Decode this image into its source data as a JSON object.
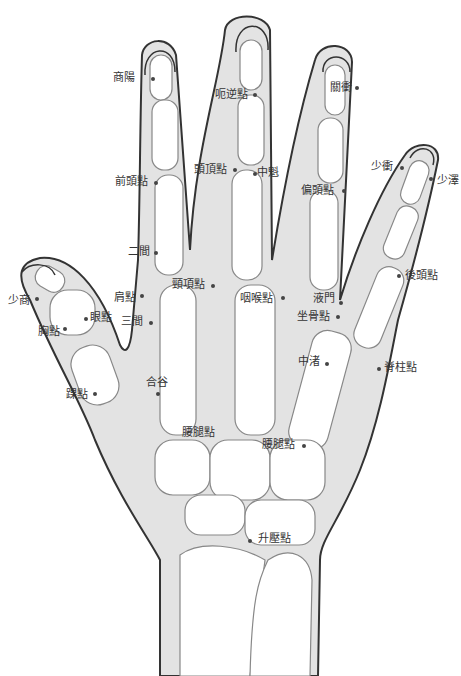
{
  "diagram": {
    "type": "hand-acupoint-chart",
    "colors": {
      "skin": "#e3e3e3",
      "bone": "#ffffff",
      "outline": "#333333",
      "bone_line": "#888888",
      "text": "#333333"
    },
    "points": [
      {
        "id": "shangyang",
        "label": "商陽",
        "x": 113,
        "y": 72,
        "dx": 152,
        "dy": 78
      },
      {
        "id": "eni",
        "label": "呃逆點",
        "x": 215,
        "y": 89,
        "dx": 254,
        "dy": 94
      },
      {
        "id": "guanchong",
        "label": "關衝",
        "x": 330,
        "y": 82,
        "dx": 356,
        "dy": 87
      },
      {
        "id": "shaochong",
        "label": "少衝",
        "x": 371,
        "y": 161,
        "dx": 401,
        "dy": 167
      },
      {
        "id": "shaoze",
        "label": "少澤",
        "x": 437,
        "y": 175,
        "dx": 430,
        "dy": 178
      },
      {
        "id": "touding",
        "label": "頭頂點",
        "x": 194,
        "y": 164,
        "dx": 234,
        "dy": 169
      },
      {
        "id": "zhongkui",
        "label": "中魁",
        "x": 257,
        "y": 167,
        "dx": 254,
        "dy": 173
      },
      {
        "id": "qiantou",
        "label": "前頭點",
        "x": 115,
        "y": 176,
        "dx": 155,
        "dy": 182
      },
      {
        "id": "piantou",
        "label": "偏頭點",
        "x": 301,
        "y": 185,
        "dx": 343,
        "dy": 190
      },
      {
        "id": "erjian",
        "label": "二間",
        "x": 128,
        "y": 246,
        "dx": 155,
        "dy": 252
      },
      {
        "id": "houtou",
        "label": "後頭點",
        "x": 405,
        "y": 270,
        "dx": 398,
        "dy": 275
      },
      {
        "id": "jingxiang",
        "label": "頸項點",
        "x": 172,
        "y": 279,
        "dx": 212,
        "dy": 285
      },
      {
        "id": "yanhou",
        "label": "咽喉點",
        "x": 240,
        "y": 293,
        "dx": 282,
        "dy": 297
      },
      {
        "id": "yemen",
        "label": "液門",
        "x": 313,
        "y": 293,
        "dx": 340,
        "dy": 302
      },
      {
        "id": "jian",
        "label": "肩點",
        "x": 114,
        "y": 292,
        "dx": 141,
        "dy": 295
      },
      {
        "id": "shaoshang",
        "label": "少商",
        "x": 8,
        "y": 295,
        "dx": 36,
        "dy": 298
      },
      {
        "id": "zuogu",
        "label": "坐骨點",
        "x": 297,
        "y": 311,
        "dx": 337,
        "dy": 316
      },
      {
        "id": "yan",
        "label": "眼點",
        "x": 90,
        "y": 312,
        "dx": 85,
        "dy": 318
      },
      {
        "id": "sanjian",
        "label": "三間",
        "x": 121,
        "y": 316,
        "dx": 150,
        "dy": 322
      },
      {
        "id": "xiong",
        "label": "胸點",
        "x": 38,
        "y": 326,
        "dx": 64,
        "dy": 328
      },
      {
        "id": "zhongzhu",
        "label": "中渚",
        "x": 298,
        "y": 356,
        "dx": 326,
        "dy": 363
      },
      {
        "id": "jizhu",
        "label": "脊柱點",
        "x": 384,
        "y": 362,
        "dx": 378,
        "dy": 368
      },
      {
        "id": "hegu",
        "label": "合谷",
        "x": 146,
        "y": 377,
        "dx": 157,
        "dy": 393
      },
      {
        "id": "huai",
        "label": "踝點",
        "x": 66,
        "y": 389,
        "dx": 94,
        "dy": 393
      },
      {
        "id": "yaotui_left",
        "label": "腰腿點",
        "x": 182,
        "y": 427,
        "dx": 0,
        "dy": 0
      },
      {
        "id": "yaotui_right",
        "label": "腰腿點",
        "x": 262,
        "y": 439,
        "dx": 303,
        "dy": 445
      },
      {
        "id": "shengya",
        "label": "升壓點",
        "x": 258,
        "y": 533,
        "dx": 249,
        "dy": 540
      }
    ]
  }
}
